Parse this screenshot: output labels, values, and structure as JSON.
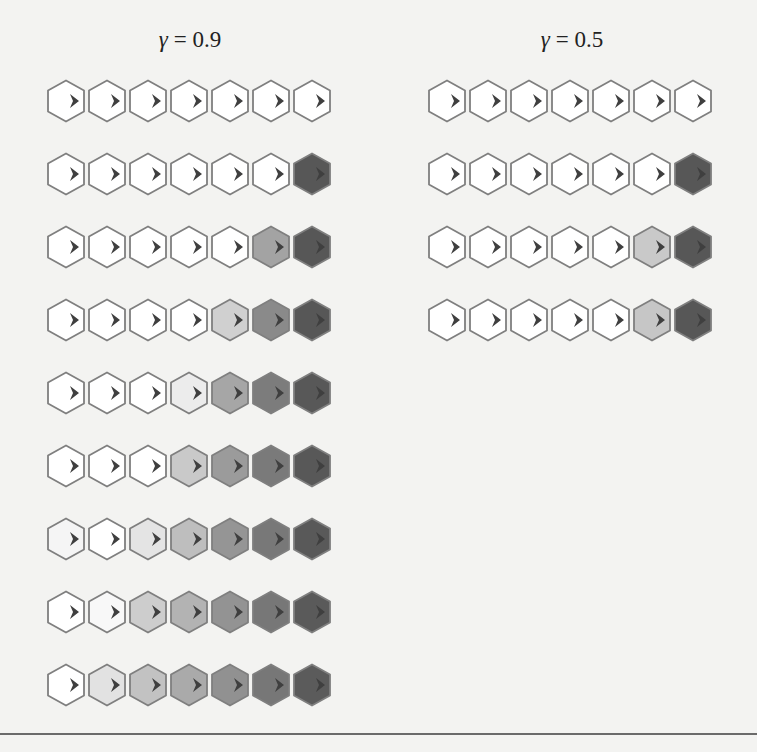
{
  "panels": [
    {
      "id": "gamma-0-9",
      "title_symbol": "γ",
      "title_rest": " = 0.9",
      "left": 46,
      "rows": [
        [
          "#ffffff",
          "#ffffff",
          "#ffffff",
          "#ffffff",
          "#ffffff",
          "#ffffff",
          "#ffffff"
        ],
        [
          "#ffffff",
          "#ffffff",
          "#ffffff",
          "#ffffff",
          "#ffffff",
          "#ffffff",
          "#575757"
        ],
        [
          "#ffffff",
          "#ffffff",
          "#ffffff",
          "#ffffff",
          "#ffffff",
          "#a3a3a3",
          "#575757"
        ],
        [
          "#ffffff",
          "#ffffff",
          "#ffffff",
          "#ffffff",
          "#d0d0d0",
          "#8a8a8a",
          "#575757"
        ],
        [
          "#ffffff",
          "#ffffff",
          "#ffffff",
          "#ececec",
          "#a6a6a6",
          "#7c7c7c",
          "#585858"
        ],
        [
          "#ffffff",
          "#ffffff",
          "#ffffff",
          "#c9c9c9",
          "#9b9b9b",
          "#7a7a7a",
          "#585858"
        ],
        [
          "#f5f5f5",
          "#ffffff",
          "#e4e4e4",
          "#bebebe",
          "#959595",
          "#787878",
          "#595959"
        ],
        [
          "#ffffff",
          "#f8f8f8",
          "#cdcdcd",
          "#b3b3b3",
          "#939393",
          "#777777",
          "#5a5a5a"
        ],
        [
          "#ffffff",
          "#e2e2e2",
          "#c2c2c2",
          "#aaaaaa",
          "#919191",
          "#777777",
          "#5b5b5b"
        ]
      ]
    },
    {
      "id": "gamma-0-5",
      "title_symbol": "γ",
      "title_rest": " = 0.5",
      "left": 427,
      "rows": [
        [
          "#ffffff",
          "#ffffff",
          "#ffffff",
          "#ffffff",
          "#ffffff",
          "#ffffff",
          "#ffffff"
        ],
        [
          "#ffffff",
          "#ffffff",
          "#ffffff",
          "#ffffff",
          "#ffffff",
          "#ffffff",
          "#575757"
        ],
        [
          "#ffffff",
          "#ffffff",
          "#ffffff",
          "#ffffff",
          "#ffffff",
          "#c9c9c9",
          "#575757"
        ],
        [
          "#ffffff",
          "#ffffff",
          "#ffffff",
          "#ffffff",
          "#ffffff",
          "#c6c6c6",
          "#575757"
        ]
      ]
    }
  ],
  "layout": {
    "row_top_start": 79,
    "row_spacing": 73,
    "hex_spacing": 41
  },
  "colors": {
    "hex_stroke": "#7f7f7f",
    "arrow": "#3f3f3f",
    "rule": "#6a6a6a"
  },
  "icons": {
    "cell_arrow": "arrowhead-right-icon",
    "cell_shape": "hexagon-icon"
  }
}
